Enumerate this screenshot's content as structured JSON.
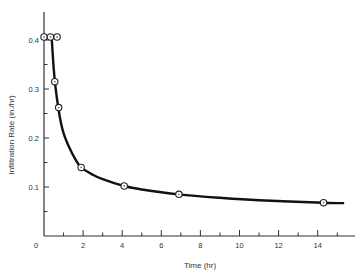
{
  "chart_data": {
    "type": "line",
    "title": "",
    "xlabel": "Time (hr)",
    "ylabel": "Infiltration Rate (in./hr)",
    "xlim": [
      0,
      16
    ],
    "ylim": [
      0,
      0.45
    ],
    "x_ticks_major": [
      0,
      2,
      4,
      6,
      8,
      10,
      12,
      14
    ],
    "x_tick_labels": [
      "0",
      "2",
      "4",
      "6",
      "8",
      "10",
      "12",
      "14"
    ],
    "y_ticks_major": [
      0.1,
      0.2,
      0.3,
      0.4
    ],
    "y_tick_labels": [
      "0.1",
      "0.2",
      "0.3",
      "0.4"
    ],
    "grid": false,
    "legend": null,
    "series": [
      {
        "name": "Observed infiltration rate",
        "style": "markers",
        "x": [
          0.0,
          0.33,
          0.67,
          0.55,
          0.75,
          1.9,
          4.1,
          6.9,
          14.3
        ],
        "y": [
          0.4,
          0.4,
          0.4,
          0.315,
          0.262,
          0.14,
          0.102,
          0.085,
          0.068
        ]
      },
      {
        "name": "Fitted curve",
        "style": "line",
        "x": [
          0.4,
          0.5,
          0.6,
          0.8,
          1.0,
          1.3,
          1.6,
          1.9,
          2.5,
          3.0,
          4.1,
          5.0,
          6.9,
          9.0,
          11.0,
          14.3,
          15.3
        ],
        "y": [
          0.4,
          0.34,
          0.3,
          0.245,
          0.21,
          0.18,
          0.157,
          0.14,
          0.125,
          0.116,
          0.102,
          0.095,
          0.085,
          0.078,
          0.073,
          0.068,
          0.067
        ]
      }
    ]
  },
  "axes": {
    "x_title": "Time (hr)",
    "y_title": "Infiltration Rate (in./hr)",
    "origin_label": "0"
  }
}
